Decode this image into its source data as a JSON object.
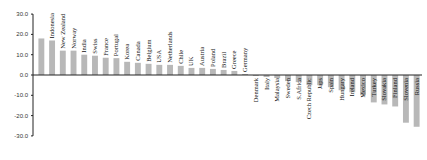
{
  "chart_data": {
    "type": "bar",
    "title": "",
    "xlabel": "",
    "ylabel": "",
    "ylim": [
      -30,
      30
    ],
    "yticks": [
      30,
      20,
      10,
      0,
      -10,
      -20,
      -30
    ],
    "grid": false,
    "legend": null,
    "bar_color": "#b8b8b8",
    "categories": [
      "",
      "Indonesia",
      "New Zealand",
      "Norway",
      "India",
      "Swiss",
      "France",
      "Portugal",
      "Korea",
      "Canada",
      "Belgium",
      "USA",
      "Netherlands",
      "Chile",
      "UK",
      "Austria",
      "Poland",
      "Brazil",
      "Greece",
      "Germany",
      "Denmark",
      "Italy",
      "Malaysia",
      "Sweden",
      "S.Africa",
      "Czech Republic",
      "Japs",
      "Spain",
      "Hungary",
      "Ireland",
      "Mexico",
      "Turkey",
      "Slovakia",
      "Finland",
      "Slovenia",
      "Russia"
    ],
    "values": [
      18,
      17,
      12,
      12,
      10,
      9.5,
      8.5,
      8.3,
      6.5,
      6,
      5.5,
      5,
      5,
      4.5,
      3.5,
      3.5,
      3,
      2.5,
      2,
      0.5,
      -0.5,
      -1,
      -1.5,
      -3,
      -3.5,
      -5,
      -5,
      -6,
      -7.5,
      -8.5,
      -10,
      -13.5,
      -14.5,
      -15.5,
      -23.5,
      -25.5
    ]
  }
}
